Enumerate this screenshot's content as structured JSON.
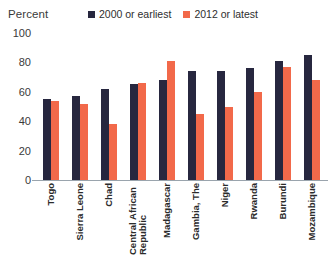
{
  "chart_data": {
    "type": "bar",
    "title": "",
    "ylabel": "Percent",
    "xlabel": "",
    "ylim": [
      0,
      100
    ],
    "yticks": [
      100,
      80,
      60,
      40,
      20,
      0
    ],
    "grid": false,
    "legend_position": "top-right",
    "categories": [
      "Togo",
      "Sierra Leone",
      "Chad",
      "Central African Republic",
      "Madagascar",
      "Gambia, The",
      "Niger",
      "Rwanda",
      "Burundi",
      "Mozambique"
    ],
    "series": [
      {
        "name": "2000 or earliest",
        "color": "#27273f",
        "values": [
          55,
          57,
          62,
          65,
          68,
          74,
          74,
          76,
          81,
          85
        ]
      },
      {
        "name": "2012 or latest",
        "color": "#f2694a",
        "values": [
          54,
          52,
          38,
          66,
          81,
          45,
          50,
          60,
          77,
          68
        ]
      }
    ]
  },
  "legend": {
    "entries": [
      {
        "label": "2000 or earliest",
        "swatch": "legend-swatch-early"
      },
      {
        "label": "2012 or latest",
        "swatch": "legend-swatch-late"
      }
    ]
  },
  "axis": {
    "y_title": "Percent"
  }
}
